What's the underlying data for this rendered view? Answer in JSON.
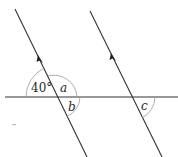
{
  "diagram": {
    "type": "parallel-lines-transversal",
    "angles": {
      "given": {
        "label": "40°",
        "value_deg": 40
      },
      "a": {
        "label": "a"
      },
      "b": {
        "label": "b"
      },
      "c": {
        "label": "c"
      }
    },
    "colors": {
      "line": "#333333",
      "arc": "#9a9a9a",
      "text": "#2a2a2a"
    }
  }
}
